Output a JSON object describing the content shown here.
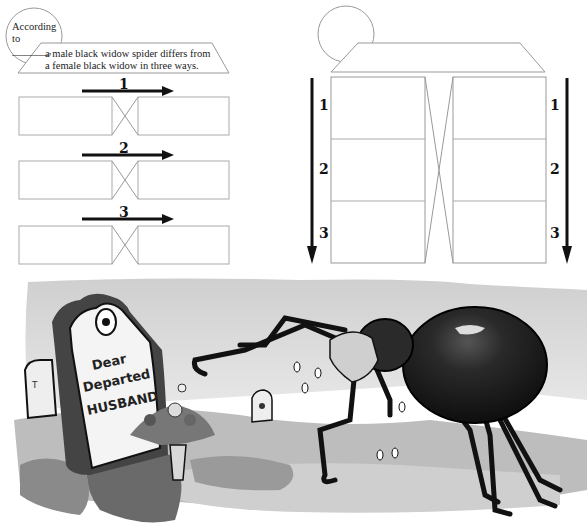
{
  "organizer": {
    "source_prompt_line1": "According",
    "source_prompt_line2": "to _______,",
    "main_idea_line1": "a male black widow spider differs from",
    "main_idea_line2": "a female black widow in three ways.",
    "left_rows": [
      {
        "number": "1",
        "left_answer": "",
        "right_answer": ""
      },
      {
        "number": "2",
        "left_answer": "",
        "right_answer": ""
      },
      {
        "number": "3",
        "left_answer": "",
        "right_answer": ""
      }
    ],
    "right_columns": {
      "left_labels": [
        "1",
        "2",
        "3"
      ],
      "right_labels": [
        "1",
        "2",
        "3"
      ],
      "title_box": "",
      "left_cells": [
        "",
        "",
        ""
      ],
      "right_cells": [
        "",
        "",
        ""
      ]
    }
  },
  "illustration": {
    "description": "Cartoon of a weeping female black widow spider beside a gravestone",
    "gravestone_text_line1": "Dear",
    "gravestone_text_line2": "Departed",
    "gravestone_text_line3": "HUSBAND",
    "colors": {
      "ink": "#111111",
      "sky_wash": "#d9d9d9",
      "ground_wash": "#a8a8a8",
      "dark_ground": "#5a5a5a",
      "spider_body": "#1e1e1e",
      "stone": "#f2f2f2"
    }
  }
}
